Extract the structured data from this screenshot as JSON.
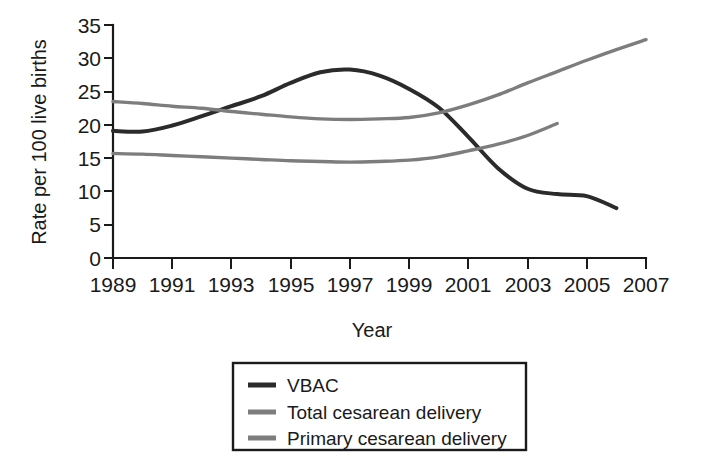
{
  "chart_data": {
    "type": "line",
    "title": "",
    "xlabel": "Year",
    "ylabel": "Rate per 100 live births",
    "xlim": [
      1989,
      2007
    ],
    "ylim": [
      0,
      35
    ],
    "grid": false,
    "legend_position": "below-plot",
    "x_ticks": [
      "1989",
      "1991",
      "1993",
      "1995",
      "1997",
      "1999",
      "2001",
      "2003",
      "2005",
      "2007"
    ],
    "y_ticks": [
      "0",
      "5",
      "10",
      "15",
      "20",
      "25",
      "30",
      "35"
    ],
    "x": [
      1989,
      1990,
      1991,
      1992,
      1993,
      1994,
      1995,
      1996,
      1997,
      1998,
      1999,
      2000,
      2001,
      2002,
      2003,
      2004,
      2005,
      2006,
      2007
    ],
    "series": [
      {
        "name": "VBAC",
        "color": "#2b2b2b",
        "linewidth": 4,
        "values": [
          19.1,
          19.0,
          19.9,
          21.3,
          22.8,
          24.3,
          26.3,
          27.9,
          28.3,
          27.4,
          25.4,
          22.6,
          18.2,
          13.5,
          10.4,
          9.6,
          9.3,
          7.5,
          null
        ]
      },
      {
        "name": "Total cesarean delivery",
        "color": "#7d7d7d",
        "linewidth": 3.4,
        "values": [
          23.5,
          23.2,
          22.8,
          22.5,
          22.0,
          21.6,
          21.2,
          20.9,
          20.8,
          20.9,
          21.1,
          21.8,
          23.0,
          24.5,
          26.3,
          28.0,
          29.7,
          31.3,
          32.8
        ]
      },
      {
        "name": "Primary cesarean delivery",
        "color": "#7d7d7d",
        "linewidth": 3.4,
        "values": [
          15.7,
          15.6,
          15.4,
          15.2,
          15.0,
          14.8,
          14.6,
          14.5,
          14.4,
          14.5,
          14.7,
          15.2,
          16.1,
          17.1,
          18.4,
          20.2,
          null,
          null,
          null
        ]
      }
    ]
  },
  "axes": {
    "y_label": "Rate per 100 live births",
    "x_label": "Year",
    "y_tick_labels": [
      "35",
      "30",
      "25",
      "20",
      "15",
      "10",
      "5",
      "0"
    ],
    "x_tick_labels": [
      "1989",
      "1991",
      "1993",
      "1995",
      "1997",
      "1999",
      "2001",
      "2003",
      "2005",
      "2007"
    ]
  },
  "legend": {
    "items": [
      {
        "label": "VBAC",
        "color": "#2b2b2b"
      },
      {
        "label": "Total cesarean delivery",
        "color": "#7d7d7d"
      },
      {
        "label": "Primary cesarean delivery",
        "color": "#7d7d7d"
      }
    ]
  }
}
